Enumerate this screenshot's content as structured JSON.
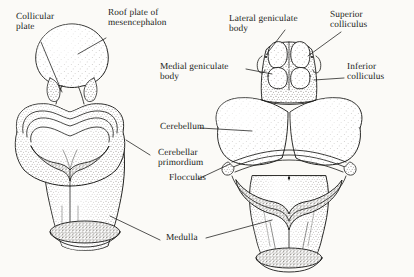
{
  "figure": {
    "background_color": "#fbfaf7",
    "ink_color": "#1a1a18",
    "stipple_color": "#6f6b63",
    "style": "pen-and-ink stippled anatomical illustration"
  },
  "labels": {
    "collicular_plate": "Collicular\nplate",
    "roof_plate": "Roof plate of\nmesencephalon",
    "medial_geniculate": "Medial geniculate\nbody",
    "cerebellum": "Cerebellum",
    "cerebellar_primordium": "Cerebellar\nprimordium",
    "flocculus": "Flocculus",
    "medulla": "Medulla",
    "lateral_geniculate": "Lateral geniculate\nbody",
    "superior_colliculus": "Superior\ncolliculus",
    "inferior_colliculus": "Inferior\ncolliculus"
  },
  "specimens": {
    "left": {
      "name": "younger-embryo-brainstem",
      "parts": [
        "roof plate of mesencephalon",
        "collicular plate",
        "cerebellar primordium",
        "medulla"
      ]
    },
    "right": {
      "name": "older-embryo-brainstem",
      "parts": [
        "superior colliculus",
        "inferior colliculus",
        "lateral geniculate body",
        "medial geniculate body",
        "cerebellum",
        "flocculus",
        "medulla"
      ]
    }
  }
}
